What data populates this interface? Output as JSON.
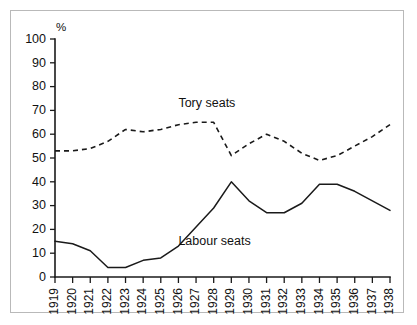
{
  "chart_data": {
    "type": "line",
    "title": "",
    "xlabel": "",
    "ylabel": "%",
    "y_unit_symbol": "%",
    "xlim": [
      1919,
      1938
    ],
    "ylim": [
      0,
      100
    ],
    "grid": false,
    "legend_position": "inline-annotation",
    "y_ticks": [
      0,
      10,
      20,
      30,
      40,
      50,
      60,
      70,
      80,
      90,
      100
    ],
    "y_tick_labels": [
      "0",
      "10",
      "20",
      "30",
      "40",
      "50",
      "60",
      "70",
      "80",
      "90",
      "100"
    ],
    "categories": [
      1919,
      1920,
      1921,
      1922,
      1923,
      1924,
      1925,
      1926,
      1927,
      1928,
      1929,
      1930,
      1931,
      1932,
      1933,
      1934,
      1935,
      1936,
      1937,
      1938
    ],
    "x_tick_labels": [
      "1919",
      "1920",
      "1921",
      "1922",
      "1923",
      "1924",
      "1925",
      "1926",
      "1927",
      "1928",
      "1929",
      "1930",
      "1931",
      "1932",
      "1933",
      "1934",
      "1935",
      "1936",
      "1937",
      "1938"
    ],
    "series": [
      {
        "name": "Tory seats",
        "style": "dashed",
        "color": "#1a1a1a",
        "label_x": 1926,
        "label_y": 73,
        "values": [
          53,
          53,
          54,
          57,
          62,
          61,
          62,
          64,
          65,
          65,
          51,
          56,
          60,
          57,
          52,
          49,
          51,
          55,
          59,
          64
        ]
      },
      {
        "name": "Labour seats",
        "style": "solid",
        "color": "#1a1a1a",
        "label_x": 1926,
        "label_y": 15,
        "values": [
          15,
          14,
          11,
          4,
          4,
          7,
          8,
          13,
          21,
          29,
          40,
          32,
          27,
          27,
          31,
          39,
          39,
          36,
          32,
          28
        ]
      }
    ]
  },
  "frame": {
    "border_color": "#b9b9b9",
    "background": "#ffffff"
  }
}
